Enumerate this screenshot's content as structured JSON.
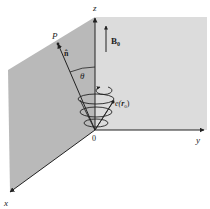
{
  "figure": {
    "axes": {
      "x_label": "x",
      "y_label": "y",
      "z_label": "z",
      "origin_label": "0"
    },
    "labels": {
      "point": "P",
      "unit_vector": "n̂",
      "angle": "θ",
      "field": "B",
      "field_sub": "0",
      "charge": "e(",
      "charge_var": "r",
      "charge_sub": "0",
      "charge_close": ")"
    },
    "colors": {
      "xz_plane": "#b9b9b9",
      "yz_plane": "#dcdcdc",
      "line": "#222222",
      "background": "#ffffff"
    }
  }
}
